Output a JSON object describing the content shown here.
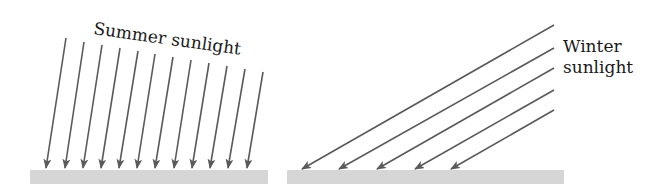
{
  "diagram": {
    "colors": {
      "background": "#ffffff",
      "ray": "#5a5a5a",
      "ground": "#d6d6d6",
      "text": "#1a1a1a"
    },
    "summer": {
      "label": "Summer sunlight",
      "label_rotation_deg": 8,
      "ray_count": 12,
      "rays": [
        {
          "x1": 66,
          "y1": 38,
          "x2": 46,
          "y2": 168
        },
        {
          "x1": 84,
          "y1": 42,
          "x2": 65,
          "y2": 168
        },
        {
          "x1": 102,
          "y1": 45,
          "x2": 83,
          "y2": 168
        },
        {
          "x1": 120,
          "y1": 48,
          "x2": 101,
          "y2": 168
        },
        {
          "x1": 138,
          "y1": 51,
          "x2": 119,
          "y2": 168
        },
        {
          "x1": 155,
          "y1": 54,
          "x2": 137,
          "y2": 168
        },
        {
          "x1": 173,
          "y1": 57,
          "x2": 155,
          "y2": 168
        },
        {
          "x1": 191,
          "y1": 60,
          "x2": 174,
          "y2": 168
        },
        {
          "x1": 209,
          "y1": 63,
          "x2": 192,
          "y2": 168
        },
        {
          "x1": 227,
          "y1": 66,
          "x2": 210,
          "y2": 168
        },
        {
          "x1": 245,
          "y1": 69,
          "x2": 228,
          "y2": 168
        },
        {
          "x1": 263,
          "y1": 72,
          "x2": 247,
          "y2": 168
        }
      ],
      "ground": {
        "x": 30,
        "y": 170,
        "width": 238,
        "height": 14
      }
    },
    "winter": {
      "label_line1": "Winter",
      "label_line2": "sunlight",
      "ray_count": 5,
      "rays": [
        {
          "x1": 554,
          "y1": 25,
          "x2": 302,
          "y2": 169
        },
        {
          "x1": 554,
          "y1": 48,
          "x2": 339,
          "y2": 169
        },
        {
          "x1": 554,
          "y1": 68,
          "x2": 377,
          "y2": 169
        },
        {
          "x1": 554,
          "y1": 90,
          "x2": 415,
          "y2": 169
        },
        {
          "x1": 554,
          "y1": 110,
          "x2": 451,
          "y2": 169
        }
      ],
      "ground": {
        "x": 287,
        "y": 170,
        "width": 277,
        "height": 14
      }
    }
  }
}
